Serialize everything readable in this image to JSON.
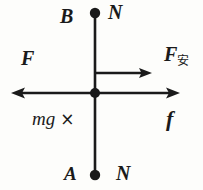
{
  "figure": {
    "kind": "force-diagram",
    "colors": {
      "background": "#fdfdfb",
      "stroke": "#1a1a1a",
      "text": "#1a1a1a"
    },
    "labels": {
      "pole_top_left": "B",
      "pole_top_right": "N",
      "force_left": "F",
      "force_ampere_base": "F",
      "force_ampere_subscript": "安",
      "weight": "mg",
      "weight_cross": "×",
      "friction": "f",
      "pole_bottom_left": "A",
      "pole_bottom_right": "N"
    },
    "vectors": [
      {
        "name": "force-left-arrow",
        "label": "F",
        "from": [
          95,
          93
        ],
        "to": [
          12,
          93
        ],
        "arrowhead": "end"
      },
      {
        "name": "force-right-arrow",
        "label": "f",
        "from": [
          95,
          93
        ],
        "to": [
          179,
          93
        ],
        "arrowhead": "end"
      },
      {
        "name": "force-ampere-arrow",
        "label": "F安",
        "from": [
          95,
          73
        ],
        "to": [
          151,
          73
        ],
        "arrowhead": "end"
      }
    ],
    "axis": {
      "vertical_name": "vertical-rod-line",
      "vertical_from": [
        95,
        14
      ],
      "vertical_to": [
        95,
        175
      ],
      "horizontal_name": "horizontal-force-line",
      "horizontal_from": [
        12,
        93
      ],
      "horizontal_to": [
        179,
        93
      ]
    },
    "nodes": [
      {
        "name": "pole-dot-top",
        "cx": 95,
        "cy": 13,
        "r": 5.2
      },
      {
        "name": "origin-dot",
        "cx": 95,
        "cy": 93,
        "r": 5.0
      },
      {
        "name": "pole-dot-bottom",
        "cx": 95,
        "cy": 175,
        "r": 5.2
      }
    ]
  }
}
